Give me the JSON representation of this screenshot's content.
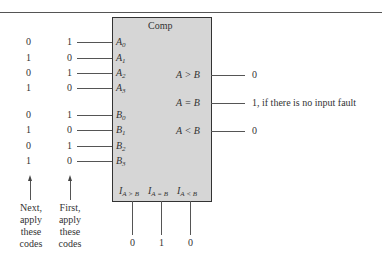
{
  "component": {
    "title": "Comp"
  },
  "inputs": [
    {
      "label": "A",
      "sub": "0",
      "next": "0",
      "first": "1"
    },
    {
      "label": "A",
      "sub": "1",
      "next": "1",
      "first": "0"
    },
    {
      "label": "A",
      "sub": "2",
      "next": "0",
      "first": "1"
    },
    {
      "label": "A",
      "sub": "3",
      "next": "1",
      "first": "0"
    },
    {
      "label": "B",
      "sub": "0",
      "next": "0",
      "first": "1"
    },
    {
      "label": "B",
      "sub": "1",
      "next": "1",
      "first": "0"
    },
    {
      "label": "B",
      "sub": "2",
      "next": "0",
      "first": "1"
    },
    {
      "label": "B",
      "sub": "3",
      "next": "1",
      "first": "0"
    }
  ],
  "outputs": [
    {
      "label": "A > B",
      "value": "0"
    },
    {
      "label": "A = B",
      "value": "1, if there is no input fault"
    },
    {
      "label": "A < B",
      "value": "0"
    }
  ],
  "cascade": [
    {
      "label": "I",
      "sub": "A > B",
      "value": "0"
    },
    {
      "label": "I",
      "sub": "A = B",
      "value": "1"
    },
    {
      "label": "I",
      "sub": "A < B",
      "value": "0"
    }
  ],
  "captions": {
    "next": [
      "Next,",
      "apply",
      "these",
      "codes"
    ],
    "first": [
      "First,",
      "apply",
      "these",
      "codes"
    ]
  }
}
